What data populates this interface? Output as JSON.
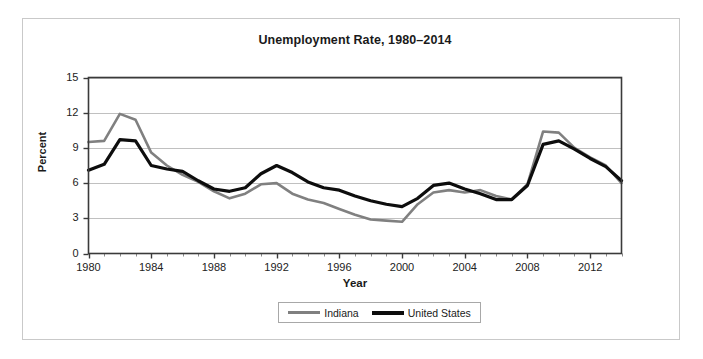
{
  "chart_data": {
    "type": "line",
    "title": "Unemployment Rate, 1980–2014",
    "xlabel": "Year",
    "ylabel": "Percent",
    "ylim": [
      0,
      15
    ],
    "xlim": [
      1980,
      2014
    ],
    "yticks": [
      0,
      3,
      6,
      9,
      12,
      15
    ],
    "ytick_labels": [
      "0",
      "3",
      "6",
      "9",
      "12",
      "15"
    ],
    "xticks": [
      1980,
      1984,
      1988,
      1992,
      1996,
      2000,
      2004,
      2008,
      2012
    ],
    "xtick_labels": [
      "1980",
      "1984",
      "1988",
      "1992",
      "1996",
      "2000",
      "2004",
      "2008",
      "2012"
    ],
    "minor_xticks_interval": 1,
    "grid": "horizontal",
    "legend_position": "bottom-center",
    "x": [
      1980,
      1981,
      1982,
      1983,
      1984,
      1985,
      1986,
      1987,
      1988,
      1989,
      1990,
      1991,
      1992,
      1993,
      1994,
      1995,
      1996,
      1997,
      1998,
      1999,
      2000,
      2001,
      2002,
      2003,
      2004,
      2005,
      2006,
      2007,
      2008,
      2009,
      2010,
      2011,
      2012,
      2013,
      2014
    ],
    "series": [
      {
        "name": "Indiana",
        "color": "#808080",
        "width": 2.6,
        "values": [
          9.5,
          9.6,
          11.9,
          11.4,
          8.6,
          7.5,
          6.7,
          6.1,
          5.3,
          4.7,
          5.1,
          5.9,
          6.0,
          5.1,
          4.6,
          4.3,
          3.8,
          3.3,
          2.9,
          2.8,
          2.7,
          4.2,
          5.2,
          5.4,
          5.2,
          5.4,
          4.9,
          4.6,
          5.9,
          10.4,
          10.3,
          9.0,
          8.2,
          7.5,
          6.0
        ]
      },
      {
        "name": "United States",
        "color": "#0d0d0d",
        "width": 3.2,
        "values": [
          7.1,
          7.6,
          9.7,
          9.6,
          7.5,
          7.2,
          7.0,
          6.2,
          5.5,
          5.3,
          5.6,
          6.8,
          7.5,
          6.9,
          6.1,
          5.6,
          5.4,
          4.9,
          4.5,
          4.2,
          4.0,
          4.7,
          5.8,
          6.0,
          5.5,
          5.1,
          4.6,
          4.6,
          5.8,
          9.3,
          9.6,
          8.9,
          8.1,
          7.4,
          6.2
        ]
      }
    ]
  },
  "legend": {
    "entries": [
      {
        "label": "Indiana"
      },
      {
        "label": "United States"
      }
    ]
  }
}
